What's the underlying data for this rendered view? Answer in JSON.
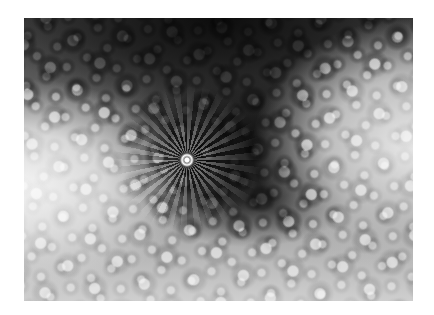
{
  "image": {
    "subject": "grayscale spiral fractal",
    "alt": "Black and white fractal spiral pattern with repeating star-shaped clusters",
    "colors": {
      "background": "#ffffff",
      "dark": "#0c0c0c",
      "light": "#f4f4f4"
    }
  }
}
